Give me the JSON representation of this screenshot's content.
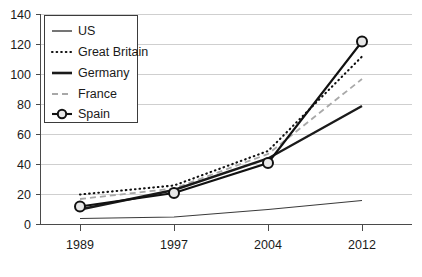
{
  "chart_data": {
    "type": "line",
    "title": "",
    "subtitle": "",
    "xlabel": "",
    "ylabel": "",
    "x": [
      "1989",
      "1997",
      "2004",
      "2012"
    ],
    "categories": [
      "1989",
      "1997",
      "2004",
      "2012"
    ],
    "xtick_labels": [
      "1989",
      "1997",
      "2004",
      "2012"
    ],
    "ytick_labels": [
      "0",
      "20",
      "40",
      "60",
      "80",
      "100",
      "120",
      "140"
    ],
    "ytick_values": [
      0,
      20,
      40,
      60,
      80,
      100,
      120,
      140
    ],
    "ylim": [
      0,
      140
    ],
    "grid": "horizontal",
    "legend_position": "top-left-inside",
    "series": [
      {
        "name": "US",
        "values": [
          4,
          5,
          10,
          16
        ],
        "style": "solid-thin",
        "color": "#333333",
        "marker": "none"
      },
      {
        "name": "Great Britain",
        "values": [
          20,
          26,
          49,
          112
        ],
        "style": "dotted",
        "color": "#1a1a1a",
        "marker": "none"
      },
      {
        "name": "Germany",
        "values": [
          10,
          23,
          44,
          79
        ],
        "style": "solid-thick",
        "color": "#1a1a1a",
        "marker": "none"
      },
      {
        "name": "France",
        "values": [
          17,
          24,
          47,
          97
        ],
        "style": "dashed",
        "color": "#a0a0a0",
        "marker": "none"
      },
      {
        "name": "Spain",
        "values": [
          12,
          21,
          41,
          122
        ],
        "style": "solid-marker",
        "color": "#111111",
        "marker": "circle"
      }
    ]
  },
  "legend": {
    "items": [
      {
        "label": "US"
      },
      {
        "label": "Great Britain"
      },
      {
        "label": "Germany"
      },
      {
        "label": "France"
      },
      {
        "label": "Spain"
      }
    ]
  },
  "axes": {
    "y": {
      "labels": [
        "140",
        "120",
        "100",
        "80",
        "60",
        "40",
        "20",
        "0"
      ]
    },
    "x": {
      "labels": [
        "1989",
        "1997",
        "2004",
        "2012"
      ]
    }
  },
  "colors": {
    "gridline": "#cfcfcf",
    "axis": "#4a4a4a",
    "text": "#1a1a1a",
    "france_gray": "#a0a0a0",
    "background": "#ffffff"
  }
}
